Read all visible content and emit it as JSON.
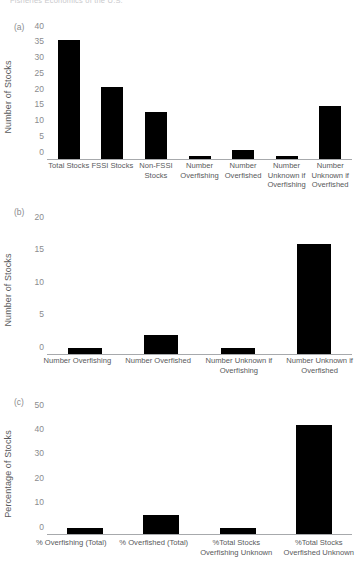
{
  "page": {
    "header_text": "Fisheries Economics of the U.S."
  },
  "chart_data": [
    {
      "type": "bar",
      "panel_label": "(a)",
      "title": "",
      "xlabel": "",
      "ylabel": "Number of Stocks",
      "ylim": [
        0,
        40
      ],
      "yticks": [
        0,
        5,
        10,
        15,
        20,
        25,
        30,
        35,
        40
      ],
      "grid": false,
      "legend": "none",
      "bar_color": "#000000",
      "categories": [
        "Total Stocks",
        "FSSI Stocks",
        "Non-FSSI Stocks",
        "Number Overfishing",
        "Number Overfished",
        "Number Unknown if Overfishing",
        "Number Unknown if Overfished"
      ],
      "category_lines": [
        [
          "Total Stocks"
        ],
        [
          "FSSI Stocks"
        ],
        [
          "Non-FSSI",
          "Stocks"
        ],
        [
          "Number",
          "Overfishing"
        ],
        [
          "Number",
          "Overfished"
        ],
        [
          "Number",
          "Unknown if",
          "Overfishing"
        ],
        [
          "Number",
          "Unknown if",
          "Overfished"
        ]
      ],
      "values": [
        38,
        23,
        15,
        1,
        3,
        1,
        17
      ]
    },
    {
      "type": "bar",
      "panel_label": "(b)",
      "title": "",
      "xlabel": "",
      "ylabel": "Number of Stocks",
      "ylim": [
        0,
        20
      ],
      "yticks": [
        0,
        5,
        10,
        15,
        20
      ],
      "grid": false,
      "legend": "none",
      "bar_color": "#000000",
      "categories": [
        "Number Overfishing",
        "Number Overfished",
        "Number Unknown if Overfishing",
        "Number Unknown if Overfished"
      ],
      "category_lines": [
        [
          "Number Overfishing"
        ],
        [
          "Number Overfished"
        ],
        [
          "Number Unknown if",
          "Overfishing"
        ],
        [
          "Number Unknown if",
          "Overfished"
        ]
      ],
      "values": [
        1,
        3,
        1,
        17
      ]
    },
    {
      "type": "bar",
      "panel_label": "(c)",
      "title": "",
      "xlabel": "",
      "ylabel": "Percentage of Stocks",
      "ylim": [
        0,
        50
      ],
      "yticks": [
        0,
        10,
        20,
        30,
        40,
        50
      ],
      "grid": false,
      "legend": "none",
      "bar_color": "#000000",
      "categories": [
        "% Overfishing (Total)",
        "% Overfished (Total)",
        "%Total Stocks Overfishing Unknown",
        "%Total Stocks Overfished Unknown"
      ],
      "category_lines": [
        [
          "% Overfishing (Total)"
        ],
        [
          "% Overfished (Total)"
        ],
        [
          "%Total Stocks",
          "Overfishing Unknown"
        ],
        [
          "%Total Stocks",
          "Overfished Unknown"
        ]
      ],
      "values": [
        2.6,
        8,
        2.6,
        45
      ]
    }
  ]
}
